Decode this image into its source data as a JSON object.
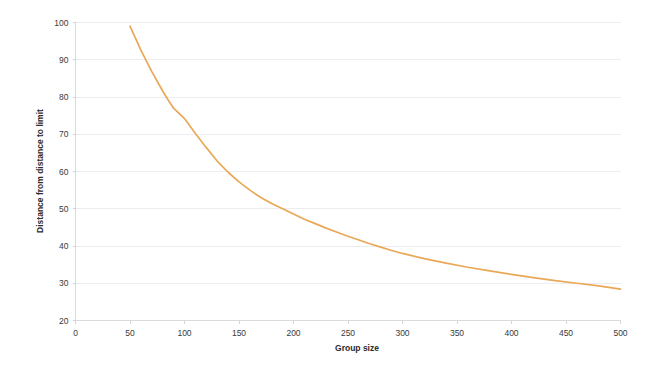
{
  "chart_data": {
    "type": "line",
    "title": "",
    "xlabel": "Group size",
    "ylabel": "Distance from distance to limit",
    "xlim": [
      0,
      500
    ],
    "ylim": [
      20,
      100
    ],
    "xticks": [
      0,
      50,
      100,
      150,
      200,
      250,
      300,
      350,
      400,
      450,
      500
    ],
    "yticks": [
      20,
      30,
      40,
      50,
      60,
      70,
      80,
      90,
      100
    ],
    "grid": true,
    "grid_axis": "y",
    "legend": false,
    "legend_position": "none",
    "line_color": "#e8a858",
    "background_color": "#ffffff",
    "grid_color": "#e9e9ee",
    "series": [
      {
        "name": "Distance from distance to limit",
        "x": [
          50,
          60,
          70,
          80,
          85,
          90,
          95,
          100,
          110,
          120,
          130,
          140,
          150,
          160,
          170,
          180,
          190,
          200,
          210,
          220,
          230,
          240,
          250,
          260,
          270,
          280,
          290,
          300,
          320,
          340,
          360,
          380,
          400,
          420,
          440,
          460,
          480,
          500
        ],
        "values": [
          99.0,
          92.6,
          86.8,
          81.6,
          79.2,
          77.0,
          75.6,
          74.2,
          70.2,
          66.4,
          62.8,
          59.8,
          57.2,
          55.0,
          53.0,
          51.4,
          50.0,
          48.6,
          47.2,
          46.0,
          44.8,
          43.7,
          42.6,
          41.6,
          40.6,
          39.7,
          38.8,
          38.0,
          36.6,
          35.4,
          34.3,
          33.3,
          32.4,
          31.5,
          30.7,
          30.0,
          29.3,
          28.4
        ]
      }
    ]
  },
  "axis_labels": {
    "x_title": "Group size",
    "y_title": "Distance from distance to limit"
  },
  "tick_text": {
    "x": [
      "0",
      "50",
      "100",
      "150",
      "200",
      "250",
      "300",
      "350",
      "400",
      "450",
      "500"
    ],
    "y": [
      "20",
      "30",
      "40",
      "50",
      "60",
      "70",
      "80",
      "90",
      "100"
    ]
  }
}
